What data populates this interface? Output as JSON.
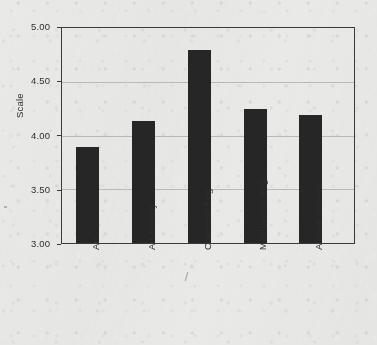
{
  "chart_data": {
    "type": "bar",
    "title": "",
    "xlabel": "",
    "ylabel": "Scale",
    "categories": [
      "Art",
      "Art History",
      "Chemical Eng.",
      "Mechanical Eng.",
      "Animal Science"
    ],
    "values": [
      3.89,
      4.14,
      4.8,
      4.25,
      4.19
    ],
    "ylim": [
      3.0,
      5.0
    ],
    "yticks": [
      "3.00",
      "3.50",
      "4.00",
      "4.50",
      "5.00"
    ],
    "ytick_values": [
      3.0,
      3.5,
      4.0,
      4.5,
      5.0
    ],
    "grid": true,
    "grid_axis": "y",
    "legend": "none",
    "bar_color": "#262626",
    "background_color": "#e9e9e7",
    "axis_color": "#3a3a3a",
    "gridline_color": "#a9a9a7"
  },
  "axes": {
    "y_title": "Scale",
    "y_labels": [
      "5.00",
      "4.50",
      "4.00",
      "3.50",
      "3.00"
    ],
    "x_labels": [
      "Art",
      "Art History",
      "Chemical Eng.",
      "Mechanical Eng.",
      "Animal Science"
    ]
  }
}
